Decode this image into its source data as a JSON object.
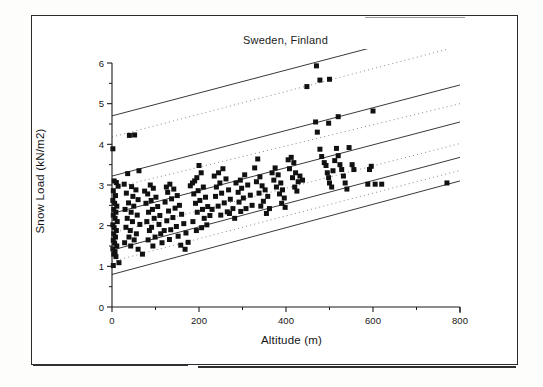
{
  "figure": {
    "title": "Sweden, Finland",
    "background_color": "#ffffff",
    "frame_color": "#2b2b2b"
  },
  "chart_data": {
    "type": "scatter",
    "title": "Sweden, Finland",
    "xlabel": "Altitude (m)",
    "ylabel": "Snow Load (kN/m2)",
    "xlim": [
      0,
      800
    ],
    "ylim": [
      0,
      6
    ],
    "xticks": [
      0,
      200,
      400,
      600,
      800
    ],
    "yticks": [
      0,
      1,
      2,
      3,
      4,
      5,
      6
    ],
    "xtick_labels": [
      "0",
      "200",
      "400",
      "600",
      "800"
    ],
    "ytick_labels": [
      "0",
      "1",
      "2",
      "3",
      "4",
      "5",
      "6"
    ],
    "x_minor_ticks": [
      100,
      300,
      500,
      700
    ],
    "y_minor_ticks": [
      0.5,
      1.5,
      2.5,
      3.5,
      4.5,
      5.5
    ],
    "grid": false,
    "legend": null,
    "marker": {
      "shape": "square",
      "color": "#111111",
      "size": 5
    },
    "series": [
      {
        "name": "Snow load measurements",
        "marker": "filled-square",
        "color": "#111111",
        "points": [
          [
            2,
            3.89
          ],
          [
            5,
            3.1
          ],
          [
            10,
            3.06
          ],
          [
            14,
            2.97
          ],
          [
            3,
            2.86
          ],
          [
            8,
            2.74
          ],
          [
            2,
            2.62
          ],
          [
            6,
            2.55
          ],
          [
            11,
            2.48
          ],
          [
            4,
            2.4
          ],
          [
            9,
            2.33
          ],
          [
            3,
            2.26
          ],
          [
            7,
            2.18
          ],
          [
            12,
            2.1
          ],
          [
            2,
            2.02
          ],
          [
            5,
            1.95
          ],
          [
            10,
            1.88
          ],
          [
            4,
            1.8
          ],
          [
            8,
            1.72
          ],
          [
            3,
            1.64
          ],
          [
            6,
            1.57
          ],
          [
            11,
            1.5
          ],
          [
            2,
            1.43
          ],
          [
            7,
            1.36
          ],
          [
            4,
            1.3
          ],
          [
            9,
            1.24
          ],
          [
            3,
            1.02
          ],
          [
            16,
            1.09
          ],
          [
            40,
            4.22
          ],
          [
            52,
            4.23
          ],
          [
            62,
            3.35
          ],
          [
            36,
            3.28
          ],
          [
            28,
            3.02
          ],
          [
            45,
            2.96
          ],
          [
            55,
            2.88
          ],
          [
            33,
            2.8
          ],
          [
            48,
            2.72
          ],
          [
            60,
            2.64
          ],
          [
            38,
            2.56
          ],
          [
            50,
            2.48
          ],
          [
            30,
            2.4
          ],
          [
            44,
            2.33
          ],
          [
            58,
            2.26
          ],
          [
            35,
            2.18
          ],
          [
            47,
            2.1
          ],
          [
            64,
            2.03
          ],
          [
            32,
            1.96
          ],
          [
            42,
            1.88
          ],
          [
            56,
            1.8
          ],
          [
            39,
            1.72
          ],
          [
            51,
            1.65
          ],
          [
            29,
            1.58
          ],
          [
            43,
            1.5
          ],
          [
            60,
            1.42
          ],
          [
            70,
            1.3
          ],
          [
            75,
            2.85
          ],
          [
            88,
            3.0
          ],
          [
            95,
            2.92
          ],
          [
            82,
            2.78
          ],
          [
            101,
            2.7
          ],
          [
            90,
            2.62
          ],
          [
            78,
            2.55
          ],
          [
            105,
            2.47
          ],
          [
            93,
            2.4
          ],
          [
            84,
            2.33
          ],
          [
            110,
            2.25
          ],
          [
            97,
            2.18
          ],
          [
            80,
            2.1
          ],
          [
            108,
            2.03
          ],
          [
            91,
            1.96
          ],
          [
            86,
            1.88
          ],
          [
            112,
            1.8
          ],
          [
            99,
            1.72
          ],
          [
            83,
            1.65
          ],
          [
            115,
            1.58
          ],
          [
            94,
            1.5
          ],
          [
            120,
            1.88
          ],
          [
            125,
            2.95
          ],
          [
            133,
            3.02
          ],
          [
            142,
            2.9
          ],
          [
            128,
            2.82
          ],
          [
            150,
            2.74
          ],
          [
            137,
            2.66
          ],
          [
            122,
            2.58
          ],
          [
            155,
            2.5
          ],
          [
            145,
            2.43
          ],
          [
            130,
            2.36
          ],
          [
            160,
            2.28
          ],
          [
            140,
            2.2
          ],
          [
            126,
            2.12
          ],
          [
            165,
            2.05
          ],
          [
            148,
            1.98
          ],
          [
            135,
            1.9
          ],
          [
            170,
            1.82
          ],
          [
            152,
            1.74
          ],
          [
            132,
            1.66
          ],
          [
            175,
            1.59
          ],
          [
            158,
            1.52
          ],
          [
            168,
            1.42
          ],
          [
            180,
            2.98
          ],
          [
            190,
            3.1
          ],
          [
            200,
            3.48
          ],
          [
            205,
            3.3
          ],
          [
            195,
            3.18
          ],
          [
            185,
            3.05
          ],
          [
            210,
            2.95
          ],
          [
            198,
            2.86
          ],
          [
            188,
            2.78
          ],
          [
            215,
            2.7
          ],
          [
            202,
            2.62
          ],
          [
            192,
            2.55
          ],
          [
            220,
            2.47
          ],
          [
            208,
            2.4
          ],
          [
            196,
            2.33
          ],
          [
            225,
            2.25
          ],
          [
            212,
            2.18
          ],
          [
            186,
            2.1
          ],
          [
            218,
            2.02
          ],
          [
            206,
            1.95
          ],
          [
            194,
            1.88
          ],
          [
            230,
            2.4
          ],
          [
            235,
            3.22
          ],
          [
            245,
            3.3
          ],
          [
            255,
            3.4
          ],
          [
            262,
            3.15
          ],
          [
            248,
            3.05
          ],
          [
            240,
            2.95
          ],
          [
            268,
            2.88
          ],
          [
            252,
            2.8
          ],
          [
            238,
            2.72
          ],
          [
            272,
            2.65
          ],
          [
            258,
            2.56
          ],
          [
            244,
            2.48
          ],
          [
            278,
            2.42
          ],
          [
            265,
            2.34
          ],
          [
            250,
            2.26
          ],
          [
            282,
            2.18
          ],
          [
            270,
            2.3
          ],
          [
            285,
            3.05
          ],
          [
            295,
            3.12
          ],
          [
            305,
            3.25
          ],
          [
            312,
            3.0
          ],
          [
            298,
            2.92
          ],
          [
            290,
            2.82
          ],
          [
            318,
            2.75
          ],
          [
            302,
            2.68
          ],
          [
            292,
            2.58
          ],
          [
            322,
            2.5
          ],
          [
            308,
            2.42
          ],
          [
            296,
            2.35
          ],
          [
            328,
            3.42
          ],
          [
            335,
            3.64
          ],
          [
            340,
            3.2
          ],
          [
            332,
            3.08
          ],
          [
            345,
            2.98
          ],
          [
            352,
            2.88
          ],
          [
            338,
            2.8
          ],
          [
            358,
            2.72
          ],
          [
            348,
            2.6
          ],
          [
            342,
            2.48
          ],
          [
            362,
            2.42
          ],
          [
            355,
            2.3
          ],
          [
            368,
            3.3
          ],
          [
            375,
            3.42
          ],
          [
            382,
            3.25
          ],
          [
            372,
            3.12
          ],
          [
            388,
            3.05
          ],
          [
            378,
            2.95
          ],
          [
            392,
            2.88
          ],
          [
            385,
            2.78
          ],
          [
            396,
            2.68
          ],
          [
            390,
            2.55
          ],
          [
            398,
            2.45
          ],
          [
            405,
            3.62
          ],
          [
            412,
            3.68
          ],
          [
            418,
            3.55
          ],
          [
            408,
            3.4
          ],
          [
            422,
            3.3
          ],
          [
            415,
            3.18
          ],
          [
            428,
            3.08
          ],
          [
            420,
            2.95
          ],
          [
            432,
            3.22
          ],
          [
            425,
            2.85
          ],
          [
            438,
            3.12
          ],
          [
            448,
            5.42
          ],
          [
            470,
            5.93
          ],
          [
            478,
            5.58
          ],
          [
            500,
            5.6
          ],
          [
            468,
            4.55
          ],
          [
            472,
            4.3
          ],
          [
            478,
            3.88
          ],
          [
            482,
            3.7
          ],
          [
            488,
            3.55
          ],
          [
            492,
            3.48
          ],
          [
            495,
            3.3
          ],
          [
            498,
            3.18
          ],
          [
            500,
            3.05
          ],
          [
            505,
            2.95
          ],
          [
            508,
            3.35
          ],
          [
            512,
            3.6
          ],
          [
            516,
            3.9
          ],
          [
            520,
            3.72
          ],
          [
            524,
            3.5
          ],
          [
            528,
            3.38
          ],
          [
            532,
            3.22
          ],
          [
            536,
            3.05
          ],
          [
            540,
            2.9
          ],
          [
            498,
            4.52
          ],
          [
            520,
            4.68
          ],
          [
            545,
            3.92
          ],
          [
            552,
            3.5
          ],
          [
            556,
            3.38
          ],
          [
            600,
            4.82
          ],
          [
            592,
            3.38
          ],
          [
            596,
            3.46
          ],
          [
            588,
            3.02
          ],
          [
            605,
            3.02
          ],
          [
            620,
            3.02
          ],
          [
            770,
            3.05
          ]
        ]
      }
    ],
    "reference_lines": [
      {
        "name": "upper-solid",
        "style": "solid",
        "from": [
          0,
          4.7
        ],
        "to": [
          800,
          6.95
        ]
      },
      {
        "name": "upper-dotted",
        "style": "dotted",
        "from": [
          0,
          4.18
        ],
        "to": [
          800,
          6.42
        ]
      },
      {
        "name": "mid-upper-solid",
        "style": "solid",
        "from": [
          0,
          3.22
        ],
        "to": [
          800,
          5.46
        ]
      },
      {
        "name": "mid-upper-dotted",
        "style": "dotted",
        "from": [
          0,
          2.92
        ],
        "to": [
          800,
          5.0
        ]
      },
      {
        "name": "mid-solid",
        "style": "solid",
        "from": [
          0,
          2.3
        ],
        "to": [
          800,
          4.55
        ]
      },
      {
        "name": "mid-lower-dotted",
        "style": "dotted",
        "from": [
          0,
          1.82
        ],
        "to": [
          800,
          4.02
        ]
      },
      {
        "name": "lower-solid",
        "style": "solid",
        "from": [
          0,
          1.4
        ],
        "to": [
          800,
          3.68
        ]
      },
      {
        "name": "bottom-dotted",
        "style": "dotted",
        "from": [
          0,
          1.12
        ],
        "to": [
          800,
          3.36
        ]
      },
      {
        "name": "bottom-solid",
        "style": "solid",
        "from": [
          0,
          0.8
        ],
        "to": [
          800,
          3.1
        ]
      }
    ]
  }
}
